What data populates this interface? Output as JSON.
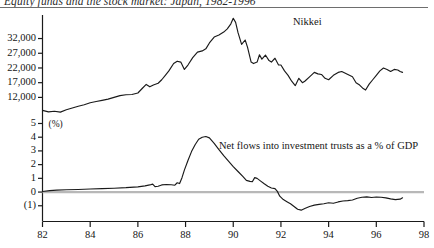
{
  "chart_data": {
    "type": "line",
    "title": "Equity funds and the stock market: Japan, 1982-1996",
    "xlabel": "",
    "ylabel": "",
    "grid": false,
    "legend_position": "inline-annotation",
    "x_axis": {
      "ticks": [
        "82",
        "84",
        "86",
        "88",
        "90",
        "92",
        "94",
        "96",
        "98"
      ],
      "range": [
        1982,
        1998
      ]
    },
    "panels": [
      {
        "name": "nikkei-panel",
        "ylabel": "",
        "yticks": [
          "32,000",
          "27,000",
          "22,000",
          "17,000",
          "12,000"
        ],
        "ytick_values": [
          32000,
          27000,
          22000,
          17000,
          12000
        ],
        "ylim": [
          5000,
          40000
        ],
        "series": [
          {
            "name": "Nikkei",
            "label": "Nikkei",
            "color": "#1a1a1a",
            "points": [
              [
                1982.0,
                7600
              ],
              [
                1982.25,
                7100
              ],
              [
                1982.5,
                7300
              ],
              [
                1982.75,
                7000
              ],
              [
                1983.0,
                7800
              ],
              [
                1983.25,
                8400
              ],
              [
                1983.5,
                9000
              ],
              [
                1983.75,
                9500
              ],
              [
                1984.0,
                10200
              ],
              [
                1984.25,
                10600
              ],
              [
                1984.5,
                11000
              ],
              [
                1984.75,
                11400
              ],
              [
                1985.0,
                12000
              ],
              [
                1985.25,
                12600
              ],
              [
                1985.5,
                12900
              ],
              [
                1985.75,
                13000
              ],
              [
                1986.0,
                13500
              ],
              [
                1986.2,
                15200
              ],
              [
                1986.35,
                16400
              ],
              [
                1986.5,
                15600
              ],
              [
                1986.65,
                16200
              ],
              [
                1986.85,
                16800
              ],
              [
                1987.0,
                18000
              ],
              [
                1987.15,
                19500
              ],
              [
                1987.3,
                21000
              ],
              [
                1987.5,
                23500
              ],
              [
                1987.65,
                24300
              ],
              [
                1987.8,
                24000
              ],
              [
                1987.95,
                21500
              ],
              [
                1988.1,
                23000
              ],
              [
                1988.3,
                25500
              ],
              [
                1988.5,
                27400
              ],
              [
                1988.7,
                27800
              ],
              [
                1988.85,
                28500
              ],
              [
                1989.0,
                30500
              ],
              [
                1989.2,
                32500
              ],
              [
                1989.4,
                33200
              ],
              [
                1989.6,
                34200
              ],
              [
                1989.75,
                35300
              ],
              [
                1989.9,
                37000
              ],
              [
                1990.0,
                38900
              ],
              [
                1990.1,
                37500
              ],
              [
                1990.2,
                34000
              ],
              [
                1990.35,
                30000
              ],
              [
                1990.5,
                31500
              ],
              [
                1990.6,
                29000
              ],
              [
                1990.75,
                24000
              ],
              [
                1990.85,
                23500
              ],
              [
                1991.0,
                24000
              ],
              [
                1991.1,
                26500
              ],
              [
                1991.2,
                25000
              ],
              [
                1991.35,
                26400
              ],
              [
                1991.5,
                24500
              ],
              [
                1991.6,
                24000
              ],
              [
                1991.75,
                25300
              ],
              [
                1991.9,
                23000
              ],
              [
                1992.0,
                23000
              ],
              [
                1992.15,
                21000
              ],
              [
                1992.3,
                19500
              ],
              [
                1992.45,
                17500
              ],
              [
                1992.6,
                16000
              ],
              [
                1992.75,
                18500
              ],
              [
                1992.9,
                17000
              ],
              [
                1993.0,
                17500
              ],
              [
                1993.2,
                19000
              ],
              [
                1993.4,
                20500
              ],
              [
                1993.55,
                20000
              ],
              [
                1993.7,
                19800
              ],
              [
                1993.85,
                18500
              ],
              [
                1994.0,
                18000
              ],
              [
                1994.2,
                19500
              ],
              [
                1994.4,
                20500
              ],
              [
                1994.55,
                20800
              ],
              [
                1994.7,
                20200
              ],
              [
                1994.85,
                19600
              ],
              [
                1995.0,
                19000
              ],
              [
                1995.15,
                17000
              ],
              [
                1995.3,
                16200
              ],
              [
                1995.45,
                15000
              ],
              [
                1995.55,
                14500
              ],
              [
                1995.7,
                16500
              ],
              [
                1995.85,
                18000
              ],
              [
                1996.0,
                19500
              ],
              [
                1996.15,
                21000
              ],
              [
                1996.3,
                22000
              ],
              [
                1996.45,
                21500
              ],
              [
                1996.6,
                20800
              ],
              [
                1996.75,
                21500
              ],
              [
                1996.9,
                21300
              ],
              [
                1997.0,
                20800
              ],
              [
                1997.1,
                20500
              ]
            ]
          }
        ]
      },
      {
        "name": "net-flows-panel",
        "unit_label": "(%)",
        "yticks": [
          "5",
          "4",
          "3",
          "2",
          "1",
          "0",
          "(1)"
        ],
        "ytick_values": [
          5,
          4,
          3,
          2,
          1,
          0,
          -1
        ],
        "ylim": [
          -1.6,
          5.4
        ],
        "zero_line": 0,
        "series": [
          {
            "name": "net-flows-into-investment-trusts",
            "label": "Net flows into investment trusts as a % of GDP",
            "color": "#1a1a1a",
            "points": [
              [
                1982.0,
                0.04
              ],
              [
                1982.3,
                0.1
              ],
              [
                1982.6,
                0.14
              ],
              [
                1983.0,
                0.17
              ],
              [
                1983.5,
                0.19
              ],
              [
                1984.0,
                0.22
              ],
              [
                1984.5,
                0.25
              ],
              [
                1985.0,
                0.28
              ],
              [
                1985.5,
                0.32
              ],
              [
                1986.0,
                0.38
              ],
              [
                1986.3,
                0.45
              ],
              [
                1986.5,
                0.52
              ],
              [
                1986.62,
                0.58
              ],
              [
                1986.72,
                0.4
              ],
              [
                1986.85,
                0.42
              ],
              [
                1987.0,
                0.52
              ],
              [
                1987.2,
                0.55
              ],
              [
                1987.4,
                0.53
              ],
              [
                1987.55,
                0.5
              ],
              [
                1987.65,
                0.68
              ],
              [
                1987.75,
                0.62
              ],
              [
                1987.85,
                1.05
              ],
              [
                1987.95,
                1.6
              ],
              [
                1988.1,
                2.3
              ],
              [
                1988.25,
                2.95
              ],
              [
                1988.4,
                3.45
              ],
              [
                1988.55,
                3.85
              ],
              [
                1988.7,
                4.0
              ],
              [
                1988.85,
                4.05
              ],
              [
                1989.0,
                3.95
              ],
              [
                1989.2,
                3.55
              ],
              [
                1989.4,
                3.1
              ],
              [
                1989.6,
                2.65
              ],
              [
                1989.8,
                2.25
              ],
              [
                1990.0,
                1.85
              ],
              [
                1990.2,
                1.5
              ],
              [
                1990.4,
                1.15
              ],
              [
                1990.55,
                0.85
              ],
              [
                1990.7,
                0.78
              ],
              [
                1990.8,
                0.75
              ],
              [
                1990.9,
                1.05
              ],
              [
                1991.0,
                1.0
              ],
              [
                1991.15,
                0.8
              ],
              [
                1991.3,
                0.6
              ],
              [
                1991.45,
                0.42
              ],
              [
                1991.6,
                0.3
              ],
              [
                1991.75,
                0.25
              ],
              [
                1991.85,
                0.05
              ],
              [
                1991.95,
                -0.3
              ],
              [
                1992.1,
                -0.55
              ],
              [
                1992.25,
                -0.7
              ],
              [
                1992.4,
                -0.85
              ],
              [
                1992.55,
                -1.05
              ],
              [
                1992.7,
                -1.25
              ],
              [
                1992.85,
                -1.32
              ],
              [
                1993.0,
                -1.2
              ],
              [
                1993.2,
                -1.05
              ],
              [
                1993.4,
                -0.95
              ],
              [
                1993.6,
                -0.9
              ],
              [
                1993.8,
                -0.85
              ],
              [
                1994.0,
                -0.78
              ],
              [
                1994.2,
                -0.82
              ],
              [
                1994.4,
                -0.72
              ],
              [
                1994.6,
                -0.65
              ],
              [
                1994.8,
                -0.62
              ],
              [
                1995.0,
                -0.58
              ],
              [
                1995.2,
                -0.45
              ],
              [
                1995.4,
                -0.38
              ],
              [
                1995.6,
                -0.35
              ],
              [
                1995.8,
                -0.4
              ],
              [
                1996.0,
                -0.36
              ],
              [
                1996.2,
                -0.38
              ],
              [
                1996.4,
                -0.42
              ],
              [
                1996.6,
                -0.5
              ],
              [
                1996.8,
                -0.55
              ],
              [
                1997.0,
                -0.52
              ],
              [
                1997.1,
                -0.42
              ]
            ]
          }
        ]
      }
    ]
  }
}
